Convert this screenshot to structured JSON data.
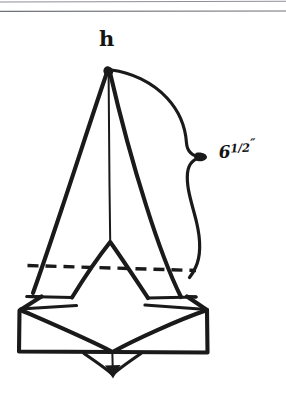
{
  "document": {
    "kind": "scanned-hand-drawn-sketch",
    "page_background": "#ffffff",
    "ink_color": "#1a1a1a",
    "rule_color": "#8d9096",
    "width": 286,
    "height": 395
  },
  "rules": {
    "top_rule_1_label": "",
    "top_rule_2_label": ""
  },
  "figure": {
    "name": "pyramid-on-base-sketch",
    "apex": {
      "x": 108,
      "y": 70
    },
    "parts": [
      "apex-point",
      "left-slant-edge",
      "right-slant-edge",
      "center-vertical-edge",
      "inner-chevron",
      "hidden-dashed-line",
      "mid-shelf-line",
      "base-box",
      "base-inner-vee",
      "bottom-arrow-tail"
    ]
  },
  "labels": {
    "apex": "h",
    "dimension": {
      "whole": "6",
      "fraction": "1/2",
      "unit_symbol": "″",
      "full_text": "6 1/2″",
      "meaning": "six and one half inches"
    }
  },
  "annotations": {
    "brace": {
      "name": "curly-brace",
      "orientation": "vertical-right",
      "spans_from": "apex",
      "spans_to": "hidden-dashed-line",
      "points_to_label": "dimension",
      "cusp": {
        "x": 203,
        "y": 157
      }
    }
  }
}
